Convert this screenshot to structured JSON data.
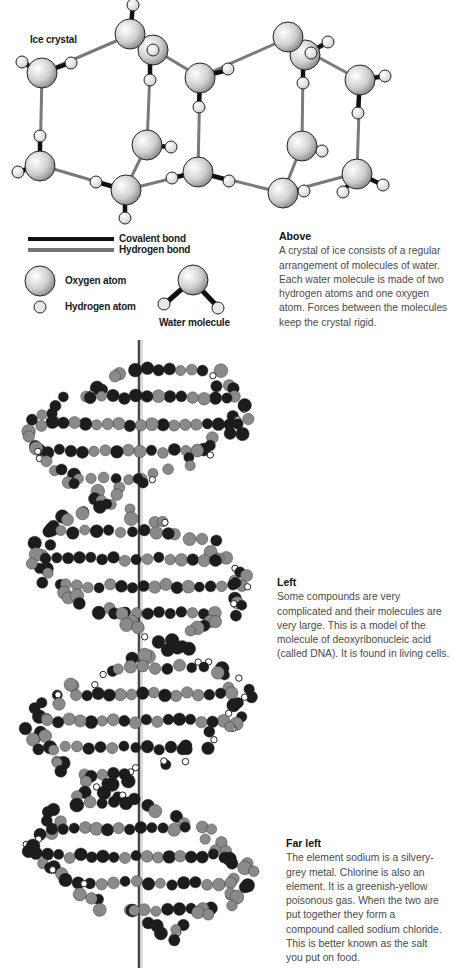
{
  "ice_crystal": {
    "title": "Ice crystal",
    "colors": {
      "covalent_bond": "#111111",
      "hydrogen_bond": "#777777",
      "atom_fill": "#d8d8d8",
      "atom_stroke": "#222222"
    }
  },
  "legend": {
    "covalent_bond": "Covalent bond",
    "hydrogen_bond": "Hydrogen bond",
    "oxygen_atom": "Oxygen atom",
    "hydrogen_atom": "Hydrogen atom",
    "water_molecule": "Water molecule"
  },
  "captions": {
    "above": {
      "heading": "Above",
      "body": "A crystal of ice consists of a regular arrangement of molecules of water. Each water molecule is made of two hydrogen atoms and one oxygen atom. Forces between the molecules keep the crystal rigid."
    },
    "left": {
      "heading": "Left",
      "body": "Some compounds are very complicated and their molecules are very large. This is a model of the molecule of deoxyribonucleic acid (called DNA). It is found in living cells."
    },
    "far_left": {
      "heading": "Far left",
      "body": "The element sodium is a silvery-grey metal. Chlorine is also an element. It is a greenish-yellow poisonous gas. When the two are put together they form a compound called sodium chloride. This is better known as the salt you put on food."
    }
  },
  "dna_model": {
    "description": "Ball-and-stick model of DNA double helix",
    "colors": {
      "dark_atom": "#1c1c1c",
      "mid_atom": "#8a8a8a",
      "light_atom": "#ffffff",
      "axis": "#444444"
    }
  }
}
